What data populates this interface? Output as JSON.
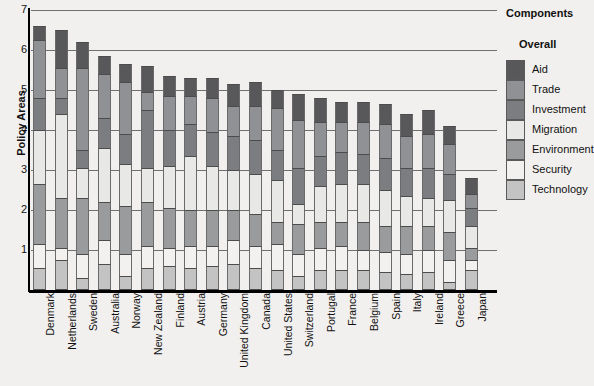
{
  "legend": {
    "title": "Components",
    "subtitle": "Overall",
    "items": [
      {
        "label": "Aid",
        "color": "#58585a"
      },
      {
        "label": "Trade",
        "color": "#909194"
      },
      {
        "label": "Investment",
        "color": "#7b7d80"
      },
      {
        "label": "Migration",
        "color": "#e8e8e6"
      },
      {
        "label": "Environment",
        "color": "#9a9b9d"
      },
      {
        "label": "Security",
        "color": "#f2f1ef"
      },
      {
        "label": "Technology",
        "color": "#c2c3c2"
      }
    ]
  },
  "axes": {
    "ylabel": "Policy Areas",
    "yticks": [
      "1",
      "2",
      "3",
      "4",
      "5",
      "6",
      "7"
    ],
    "ymin": 0,
    "ymax": 7
  },
  "chart_data": {
    "type": "bar",
    "title": "",
    "subtitle": "",
    "xlabel": "",
    "ylabel": "Policy Areas",
    "ylim": [
      0,
      7
    ],
    "grid": true,
    "stacked": true,
    "legend_position": "right",
    "legend_title": "Components",
    "legend_subtitle": "Overall",
    "categories": [
      "Denmark",
      "Netherlands",
      "Sweden",
      "Australia",
      "Norway",
      "New Zealand",
      "Finland",
      "Austria",
      "Germany",
      "United Kingdom",
      "Canada",
      "United States",
      "Switzerland",
      "Portugal",
      "France",
      "Belgium",
      "Spain",
      "Italy",
      "Ireland",
      "Greece",
      "Japan"
    ],
    "series": [
      {
        "name": "Technology",
        "color": "#c2c3c2",
        "values": [
          0.55,
          0.75,
          0.3,
          0.65,
          0.35,
          0.55,
          0.6,
          0.55,
          0.6,
          0.65,
          0.55,
          0.5,
          0.35,
          0.5,
          0.5,
          0.5,
          0.45,
          0.4,
          0.45,
          0.2,
          0.5
        ]
      },
      {
        "name": "Security",
        "color": "#f2f1ef",
        "values": [
          0.6,
          0.3,
          0.6,
          0.6,
          0.55,
          0.55,
          0.45,
          0.55,
          0.5,
          0.6,
          0.55,
          0.65,
          0.55,
          0.55,
          0.6,
          0.5,
          0.5,
          0.5,
          0.55,
          0.55,
          0.25
        ]
      },
      {
        "name": "Environment",
        "color": "#9a9b9d",
        "values": [
          1.5,
          1.25,
          1.4,
          0.95,
          1.2,
          1.1,
          1.0,
          0.9,
          0.9,
          0.75,
          0.8,
          0.55,
          0.75,
          0.65,
          0.6,
          0.7,
          0.65,
          0.7,
          0.6,
          0.7,
          0.3
        ]
      },
      {
        "name": "Migration",
        "color": "#e8e8e6",
        "values": [
          1.35,
          2.1,
          0.75,
          1.35,
          1.05,
          0.85,
          1.05,
          1.35,
          1.1,
          1.0,
          1.0,
          1.05,
          0.5,
          0.9,
          0.95,
          0.95,
          0.9,
          0.75,
          0.7,
          0.8,
          0.55
        ]
      },
      {
        "name": "Investment",
        "color": "#7b7d80",
        "values": [
          0.8,
          0.4,
          0.45,
          0.75,
          0.75,
          1.45,
          0.9,
          0.8,
          0.85,
          0.85,
          0.85,
          0.75,
          0.9,
          0.75,
          0.8,
          0.75,
          0.8,
          0.7,
          0.75,
          0.65,
          0.45
        ]
      },
      {
        "name": "Trade",
        "color": "#909194",
        "values": [
          1.45,
          0.75,
          2.05,
          1.1,
          1.3,
          0.45,
          0.85,
          0.7,
          0.85,
          0.75,
          0.85,
          1.05,
          1.2,
          0.85,
          0.75,
          0.8,
          0.85,
          0.8,
          0.85,
          0.75,
          0.35
        ]
      },
      {
        "name": "Aid",
        "color": "#58585a",
        "values": [
          0.35,
          0.95,
          0.65,
          0.45,
          0.45,
          0.65,
          0.5,
          0.45,
          0.5,
          0.55,
          0.6,
          0.45,
          0.65,
          0.6,
          0.5,
          0.5,
          0.5,
          0.55,
          0.6,
          0.45,
          0.4
        ]
      }
    ],
    "totals": [
      6.6,
      6.5,
      6.2,
      5.85,
      5.65,
      5.6,
      5.35,
      5.3,
      5.3,
      5.15,
      5.2,
      5.0,
      4.9,
      4.8,
      4.7,
      4.7,
      4.65,
      4.4,
      4.5,
      4.1,
      2.8
    ]
  }
}
